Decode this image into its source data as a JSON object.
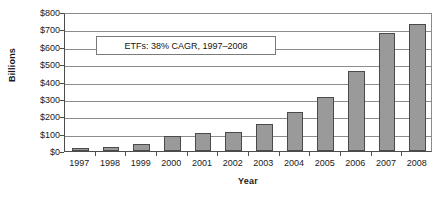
{
  "chart_data": {
    "type": "bar",
    "title": "",
    "xlabel": "Year",
    "ylabel": "Billions",
    "categories": [
      "1997",
      "1998",
      "1999",
      "2000",
      "2001",
      "2002",
      "2003",
      "2004",
      "2005",
      "2006",
      "2007",
      "2008"
    ],
    "values": [
      18,
      22,
      42,
      85,
      102,
      110,
      155,
      225,
      310,
      460,
      680,
      730
    ],
    "series": [
      {
        "name": "ETF assets",
        "values": [
          18,
          22,
          42,
          85,
          102,
          110,
          155,
          225,
          310,
          460,
          680,
          730
        ]
      }
    ],
    "ylim": [
      0,
      800
    ],
    "ytick_step": 100,
    "ytick_labels": [
      "$0",
      "$100",
      "$200",
      "$300",
      "$400",
      "$500",
      "$600",
      "$700",
      "$800"
    ],
    "ytick_values": [
      0,
      100,
      200,
      300,
      400,
      500,
      600,
      700,
      800
    ],
    "grid": "horizontal",
    "legend": "none",
    "bar_color": "#9a9a9a",
    "bar_border_color": "#4a4a4a",
    "gridline_color": "#8c8c8c",
    "axis_color": "#4d4d4d",
    "annotations": [
      {
        "text": "ETFs: 38% CAGR, 1997–2008"
      }
    ]
  }
}
